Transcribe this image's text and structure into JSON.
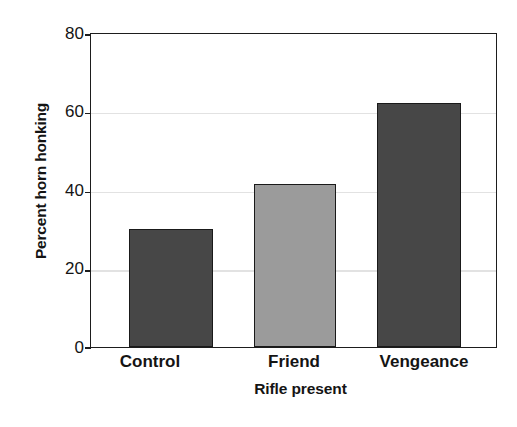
{
  "chart_data": {
    "type": "bar",
    "title": "",
    "subtitle": "",
    "xlabel": "Rifle present",
    "ylabel": "Percent horn honking",
    "categories": [
      "Control",
      "Friend",
      "Vengeance"
    ],
    "values": [
      30,
      41.5,
      62
    ],
    "ylim": [
      0,
      80
    ],
    "yticks": [
      0,
      20,
      40,
      60,
      80
    ],
    "ytick_labels": [
      "0",
      "20",
      "40",
      "60",
      "80"
    ],
    "grid": true,
    "grid_axis": "y",
    "legend": "none",
    "bar_colors": [
      "#474747",
      "#9b9b9b",
      "#474747"
    ],
    "bar_edge_color": "#1a1a1a",
    "axis_color": "#1d1d1d",
    "grid_color": "#e2e2e2",
    "background_color": "#ffffff",
    "series": [
      {
        "name": "Percent horn honking",
        "values": [
          30,
          41.5,
          62
        ]
      }
    ],
    "points": [
      {
        "category": "Control",
        "value": 30,
        "color": "#474747"
      },
      {
        "category": "Friend",
        "value": 41.5,
        "color": "#9b9b9b"
      },
      {
        "category": "Vengeance",
        "value": 62,
        "color": "#474747"
      }
    ]
  }
}
